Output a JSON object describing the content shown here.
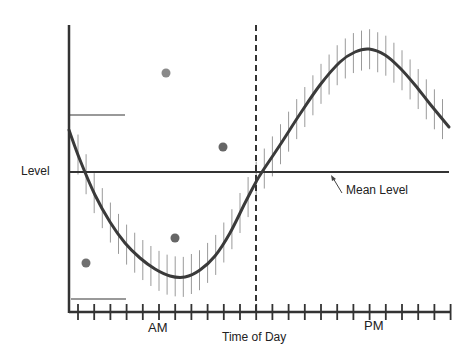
{
  "chart_data": {
    "type": "line",
    "title": "",
    "xlabel": "Time of Day",
    "ylabel": "Level",
    "x_region_labels": [
      "AM",
      "PM"
    ],
    "annotations": [
      {
        "text": "Mean Level",
        "points_to": "horizontal mean line"
      }
    ],
    "series": [
      {
        "name": "daily rhythm curve (with error bars)",
        "color": "#3a3a3a",
        "points_px": [
          [
            69,
            130
          ],
          [
            80,
            160
          ],
          [
            95,
            195
          ],
          [
            110,
            222
          ],
          [
            125,
            243
          ],
          [
            140,
            258
          ],
          [
            155,
            269
          ],
          [
            170,
            276
          ],
          [
            185,
            277
          ],
          [
            200,
            270
          ],
          [
            215,
            256
          ],
          [
            230,
            233
          ],
          [
            245,
            203
          ],
          [
            256,
            182
          ],
          [
            262,
            172
          ],
          [
            280,
            145
          ],
          [
            300,
            114
          ],
          [
            320,
            85
          ],
          [
            340,
            62
          ],
          [
            355,
            52
          ],
          [
            369,
            49
          ],
          [
            385,
            55
          ],
          [
            400,
            68
          ],
          [
            415,
            85
          ],
          [
            430,
            104
          ],
          [
            449,
            127
          ]
        ],
        "error_bar_halfheight_px": 20
      }
    ],
    "scatter_points": [
      {
        "x": 166,
        "y": 73,
        "color": "#8a8a8a"
      },
      {
        "x": 223,
        "y": 147,
        "color": "#666666"
      },
      {
        "x": 175,
        "y": 238,
        "color": "#666666"
      },
      {
        "x": 86,
        "y": 263,
        "color": "#707070"
      }
    ],
    "reference_lines": {
      "mean_level_y": 172,
      "dashed_vertical_x": 256,
      "upper_short_line": {
        "y": 115,
        "x1": 70,
        "x2": 125
      },
      "lower_short_line": {
        "y": 299,
        "x1": 71,
        "x2": 126
      }
    },
    "axes": {
      "y_axis": {
        "x": 69,
        "y1": 25,
        "y2": 313
      },
      "x_axis": {
        "y": 312,
        "x1": 69,
        "x2": 451
      },
      "tick_start_x": 78,
      "tick_spacing": 16.2,
      "tick_count": 24
    },
    "grid": false,
    "legend": null
  },
  "labels": {
    "y_label": "Level",
    "mean_label": "Mean Level",
    "am": "AM",
    "pm": "PM",
    "x_title": "Time of Day"
  }
}
